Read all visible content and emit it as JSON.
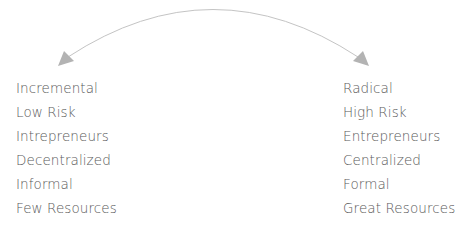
{
  "diagram": {
    "arrow": {
      "type": "double-headed-curved-arrow",
      "color": "#b3b3b3"
    },
    "left_column": {
      "items": [
        "Incremental",
        "Low Risk",
        "Intrepreneurs",
        "Decentralized",
        "Informal",
        "Few Resources"
      ]
    },
    "right_column": {
      "items": [
        "Radical",
        "High Risk",
        "Entrepreneurs",
        "Centralized",
        "Formal",
        "Great Resources"
      ]
    },
    "text_color": "#5a5a5a"
  }
}
